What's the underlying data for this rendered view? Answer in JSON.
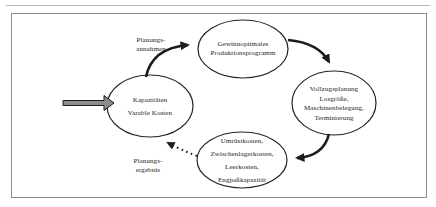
{
  "diagram": {
    "title_hint": "Produktionsplanung Kreislauf",
    "nodes": {
      "kapazitaeten": {
        "lines": [
          "Kapazitäten",
          "Varable Kosten"
        ]
      },
      "produktionsprogramm": {
        "lines": [
          "Gewinnoptimales",
          "Produktionsprogramm"
        ]
      },
      "vollzugsplanung": {
        "lines": [
          "Vollzugsplanung",
          "Losgröße,",
          "Maschinenbelegung,",
          "Terminierung"
        ]
      },
      "kosten": {
        "lines": [
          "Umrüstkosten,",
          "Zwischenlagerkosten,",
          "Leerkosten,",
          "Engpaßkapazität"
        ]
      }
    },
    "edge_labels": {
      "annahmen": {
        "lines": [
          "Planungs-",
          "annahmen"
        ]
      },
      "ergebnis": {
        "lines": [
          "Planungs-",
          "ergebnis"
        ]
      }
    },
    "colors": {
      "stroke": "#1c1c1c",
      "frame": "#8f8f8f",
      "page_rule": "#b9b9b9",
      "block_arrow_fill": "#8c8c8c",
      "background": "#ffffff"
    }
  }
}
